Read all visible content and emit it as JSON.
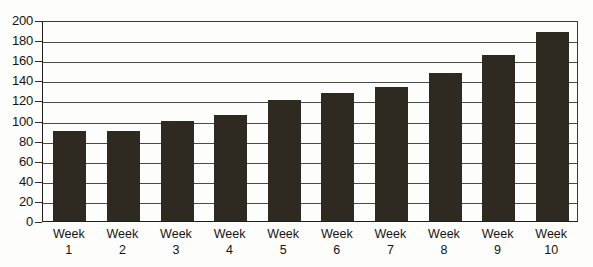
{
  "chart_data": {
    "type": "bar",
    "title": "",
    "subtitle": "",
    "xlabel": "",
    "ylabel": "",
    "categories": [
      "Week 1",
      "Week 2",
      "Week 3",
      "Week 4",
      "Week 5",
      "Week 6",
      "Week 7",
      "Week 8",
      "Week 9",
      "Week 10"
    ],
    "category_lines": [
      [
        "Week",
        "1"
      ],
      [
        "Week",
        "2"
      ],
      [
        "Week",
        "3"
      ],
      [
        "Week",
        "4"
      ],
      [
        "Week",
        "5"
      ],
      [
        "Week",
        "6"
      ],
      [
        "Week",
        "7"
      ],
      [
        "Week",
        "8"
      ],
      [
        "Week",
        "9"
      ],
      [
        "Week",
        "10"
      ]
    ],
    "values": [
      90,
      90,
      100,
      105,
      120,
      127,
      133,
      147,
      165,
      188
    ],
    "ylim": [
      0,
      200
    ],
    "ytick_step": 20,
    "yticks": [
      0,
      20,
      40,
      60,
      80,
      100,
      120,
      140,
      160,
      180,
      200
    ],
    "ytick_labels": [
      "0",
      "20",
      "40",
      "60",
      "80",
      "100",
      "120",
      "140",
      "160",
      "180",
      "200"
    ],
    "grid": true,
    "grid_axis": "y",
    "legend": false,
    "legend_position": "none",
    "bar_color": "#2e2a22",
    "grid_color": "#4a4a4a",
    "axis_color": "#1e1e1e",
    "background_color": "#fdfdfb"
  }
}
